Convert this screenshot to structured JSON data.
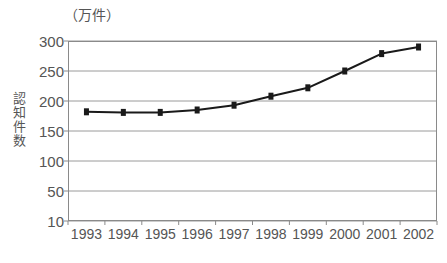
{
  "chart_data": {
    "type": "line",
    "title": "",
    "unit_label": "（万件）",
    "ylabel": "認知件数",
    "xlabel": "",
    "categories": [
      "1993",
      "1994",
      "1995",
      "1996",
      "1997",
      "1998",
      "1999",
      "2000",
      "2001",
      "2002"
    ],
    "values": [
      182,
      181,
      181,
      185,
      193,
      208,
      222,
      250,
      279,
      290
    ],
    "series": [
      {
        "name": "認知件数",
        "values": [
          182,
          181,
          181,
          185,
          193,
          208,
          222,
          250,
          279,
          290
        ]
      }
    ],
    "y_ticks": [
      300,
      250,
      200,
      150,
      100,
      50,
      10
    ],
    "y_tick_labels": [
      "300",
      "250",
      "200",
      "150",
      "100",
      "50",
      "10"
    ],
    "ylim": [
      10,
      300
    ],
    "grid": true,
    "legend": "none",
    "marker": "square",
    "line_color": "#1a1a1a",
    "marker_color": "#1a1a1a",
    "grid_color": "#9a9a9a",
    "axis_color": "#8a8a8a",
    "background": "#ffffff"
  }
}
